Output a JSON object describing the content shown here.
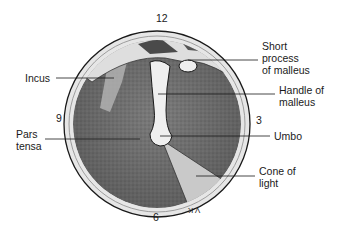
{
  "clock_positions": {
    "top": "12",
    "right": "3",
    "bottom": "6",
    "left": "9"
  },
  "labels": [
    {
      "id": "incus",
      "text": "Incus"
    },
    {
      "id": "short-process",
      "text": "Short\nprocess\nof malleus"
    },
    {
      "id": "handle",
      "text": "Handle of\nmalleus"
    },
    {
      "id": "pars-tensa",
      "text": "Pars\ntensa"
    },
    {
      "id": "umbo",
      "text": "Umbo"
    },
    {
      "id": "cone",
      "text": "Cone of\nlight"
    }
  ],
  "signature": "V.K",
  "colors": {
    "ink": "#1a1a1a",
    "membrane_dark": "#6e6e6e",
    "membrane_mid": "#8a8a8a",
    "rim_light": "#e4e4e4",
    "bone_light": "#ececec",
    "cone_light": "#bdbdbd"
  }
}
